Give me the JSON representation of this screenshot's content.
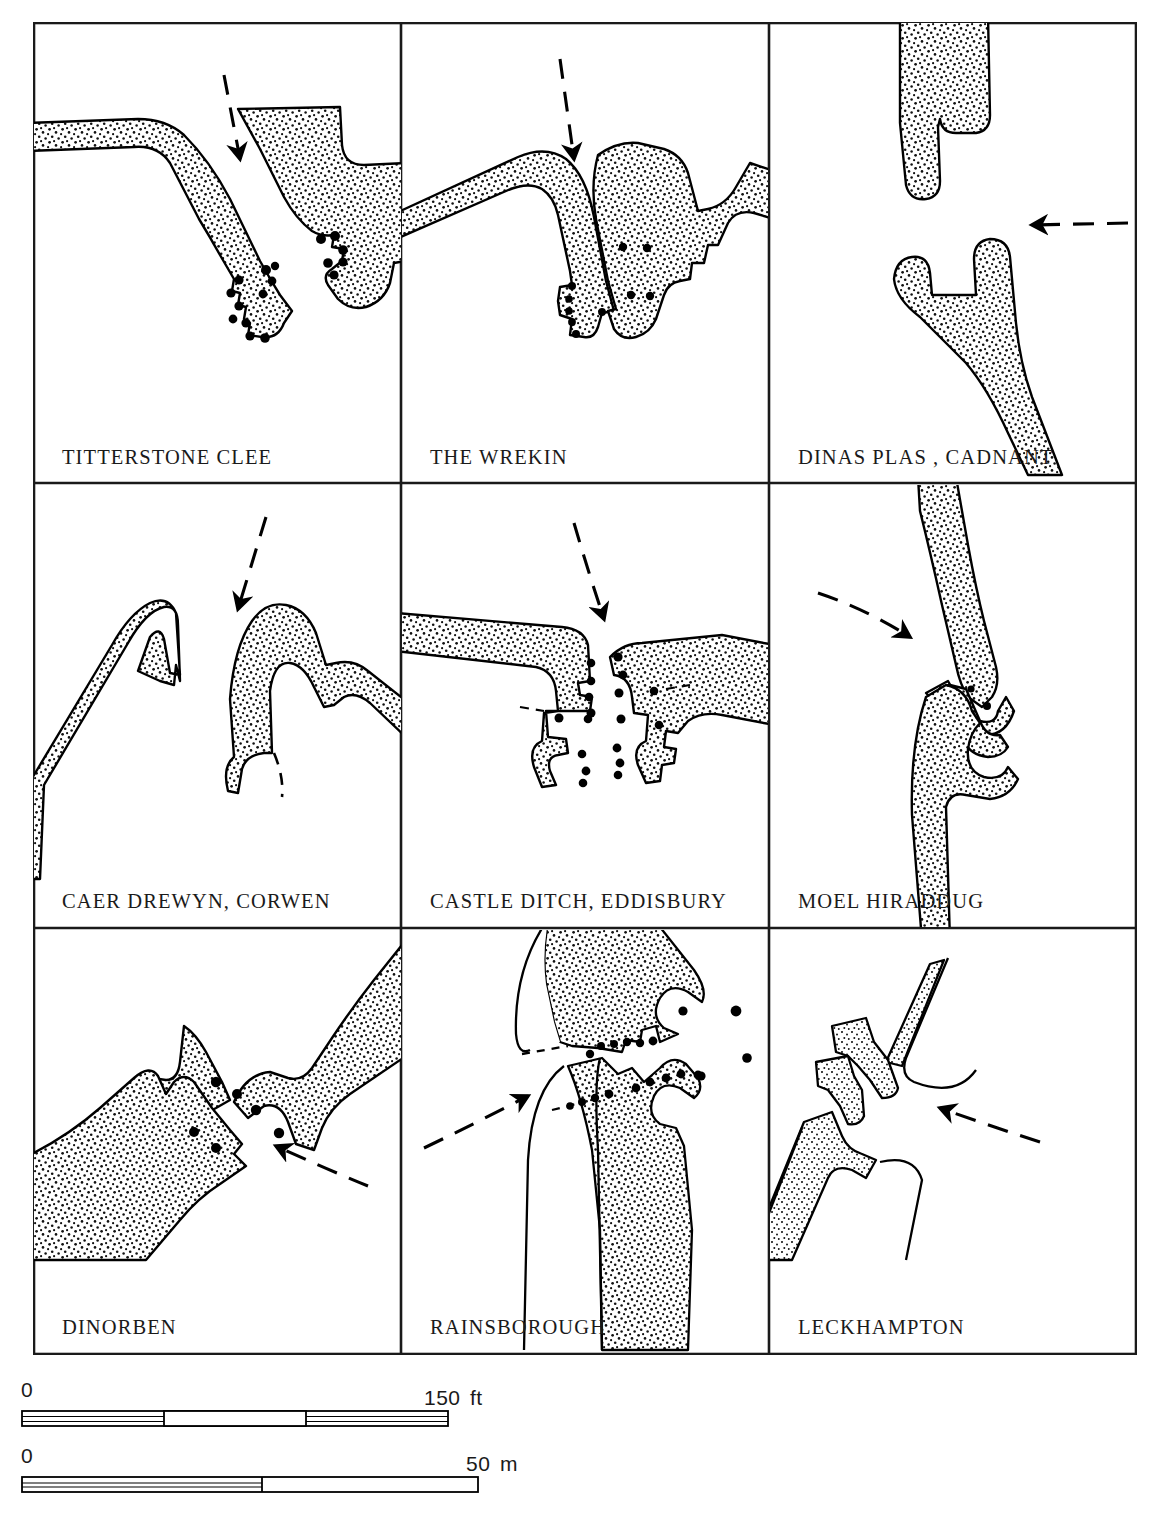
{
  "figure": {
    "kind": "archaeological-plan-grid",
    "rows": 3,
    "cols": 3,
    "legend_colors": {
      "rampart_fill": "#ffffff",
      "rampart_outline": "#000000",
      "stipple": "#000000",
      "posthole": "#000000",
      "approach_arrow": "#000000",
      "frame": "#1a1a1a"
    }
  },
  "panels": [
    {
      "id": "titterstone-clee",
      "label": "TITTERSTONE  CLEE",
      "approach": "from north, down-right",
      "guard_chambers": 0,
      "postholes": 16
    },
    {
      "id": "the-wrekin",
      "label": "THE WREKIN",
      "approach": "from north, straight down",
      "guard_chambers": 0,
      "postholes": 10
    },
    {
      "id": "dinas-plas-cadnant",
      "label": "DINAS  PLAS , CADNANT",
      "approach": "from east, leftward",
      "guard_chambers": 0,
      "postholes": 0
    },
    {
      "id": "caer-drewyn-corwen",
      "label": "CAER  DREWYN, CORWEN",
      "approach": "from north, down-left",
      "guard_chambers": 0,
      "postholes": 0
    },
    {
      "id": "castle-ditch-eddisbury",
      "label": "CASTLE  DITCH, EDDISBURY",
      "approach": "from north, straight down",
      "guard_chambers": 0,
      "postholes": 18
    },
    {
      "id": "moel-hiraddug",
      "label": "MOEL  HIRADDUG",
      "approach": "from west, rightward",
      "guard_chambers": 1,
      "postholes": 2
    },
    {
      "id": "dinorben",
      "label": "DINORBEN",
      "approach": "from south-east, up-left",
      "guard_chambers": 0,
      "postholes": 6
    },
    {
      "id": "rainsborough",
      "label": "RAINSBOROUGH",
      "approach": "from south-west, up-right",
      "guard_chambers": 2,
      "postholes": 20
    },
    {
      "id": "leckhampton",
      "label": "LECKHAMPTON",
      "approach": "from east, leftward",
      "guard_chambers": 0,
      "postholes": 0
    }
  ],
  "scales": [
    {
      "id": "scale-feet",
      "zero_label": "0",
      "max_label": "150",
      "unit_label": "ft",
      "segments": 3,
      "filled_pattern": [
        "line",
        "blank",
        "line"
      ]
    },
    {
      "id": "scale-metres",
      "zero_label": "0",
      "max_label": "50",
      "unit_label": "m",
      "segments": 2,
      "filled_pattern": [
        "line",
        "blank"
      ]
    }
  ]
}
